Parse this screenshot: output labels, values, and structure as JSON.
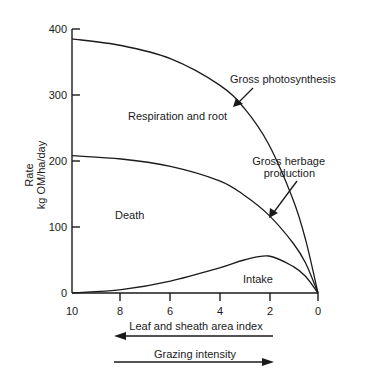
{
  "chart_data": {
    "type": "line",
    "title": "",
    "xlabel": "Leaf and sheath area index",
    "ylabel": "Rate",
    "ylabel_units": "kg OM/ha/day",
    "x_reversed": true,
    "xlim": [
      10,
      0
    ],
    "ylim": [
      0,
      400
    ],
    "x_ticks": [
      10,
      8,
      6,
      4,
      2,
      0
    ],
    "y_ticks": [
      0,
      100,
      200,
      300,
      400
    ],
    "grid": false,
    "x": [
      10,
      8,
      6,
      4,
      3,
      2,
      1,
      0.5,
      0
    ],
    "series": [
      {
        "name": "Gross photosynthesis",
        "values": [
          385,
          375,
          355,
          315,
          280,
          225,
          140,
          80,
          0
        ]
      },
      {
        "name": "Gross herbage production",
        "values": [
          208,
          203,
          192,
          170,
          148,
          118,
          75,
          45,
          0
        ]
      },
      {
        "name": "Intake",
        "values": [
          0,
          5,
          18,
          38,
          50,
          56,
          40,
          25,
          0
        ]
      }
    ],
    "region_labels": [
      {
        "text": "Respiration and root",
        "x": 6.8,
        "y": 265
      },
      {
        "text": "Death",
        "x": 7.9,
        "y": 115
      },
      {
        "text": "Intake",
        "x": 2.8,
        "y": 17
      }
    ],
    "annotations": [
      {
        "text": "Gross photosynthesis",
        "arrow_to_series": "Gross photosynthesis"
      },
      {
        "text": "Gross herbage production",
        "lines": [
          "Gross herbage",
          "production"
        ],
        "arrow_to_series": "Gross herbage production"
      }
    ],
    "direction_arrows": [
      {
        "label": "Leaf and sheath area index",
        "direction": "left"
      },
      {
        "label": "Grazing intensity",
        "direction": "right"
      }
    ]
  },
  "labels": {
    "ylabel_line1": "Rate",
    "ylabel_line2": "kg OM/ha/day",
    "xlabel": "Leaf and sheath area index",
    "grazing": "Grazing intensity",
    "resp": "Respiration and root",
    "death": "Death",
    "intake": "Intake",
    "gp": "Gross photosynthesis",
    "ghp1": "Gross herbage",
    "ghp2": "production"
  }
}
